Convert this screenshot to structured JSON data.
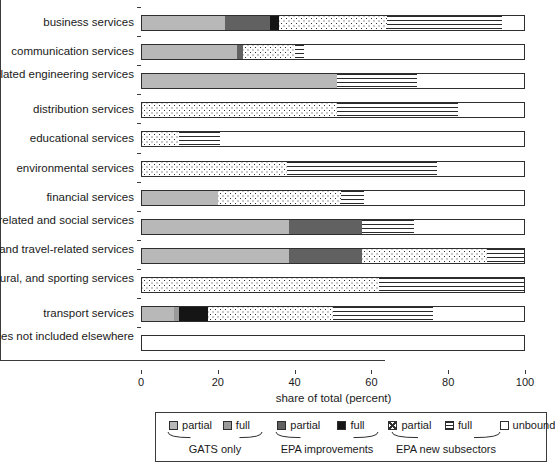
{
  "chart_data": {
    "type": "bar",
    "orientation": "horizontal",
    "stacked": true,
    "title": "",
    "xlabel": "share of total (percent)",
    "ylabel": "",
    "xlim": [
      0,
      100
    ],
    "xticks": [
      0,
      20,
      40,
      60,
      80,
      100
    ],
    "xtick_labels": [
      "0",
      "20",
      "40",
      "60",
      "80",
      "100"
    ],
    "grid": false,
    "legend_position": "bottom",
    "categories": [
      "business services",
      "communication services",
      "construction and related engineering services",
      "distribution services",
      "educational services",
      "environmental services",
      "financial services",
      "health-related and social services",
      "tourism and travel-related services",
      "recreational, cultural, and sporting services",
      "transport services",
      "other services not included elsewhere"
    ],
    "series": [
      {
        "name": "GATS only partial",
        "key": "gats_partial",
        "values": [
          22.0,
          25.0,
          51.0,
          0.0,
          0.0,
          0.0,
          20.0,
          38.5,
          38.5,
          0.0,
          8.5,
          0.0
        ]
      },
      {
        "name": "GATS only full",
        "key": "gats_full",
        "values": [
          0.0,
          0.0,
          0.0,
          0.0,
          0.0,
          0.0,
          0.0,
          0.0,
          0.0,
          0.0,
          1.5,
          0.0
        ]
      },
      {
        "name": "EPA improvements partial",
        "key": "epa_partial",
        "values": [
          11.5,
          1.5,
          0.0,
          0.0,
          0.0,
          0.0,
          0.0,
          19.0,
          19.0,
          0.0,
          0.0,
          0.0
        ]
      },
      {
        "name": "EPA improvements full",
        "key": "epa_full",
        "values": [
          2.5,
          0.0,
          0.0,
          0.0,
          0.0,
          0.0,
          0.0,
          0.0,
          0.0,
          0.0,
          7.5,
          0.0
        ]
      },
      {
        "name": "EPA new subsectors partial",
        "key": "new_partial",
        "values": [
          28.0,
          13.5,
          0.0,
          51.0,
          10.0,
          38.0,
          32.0,
          0.0,
          32.5,
          62.0,
          32.5,
          0.0
        ]
      },
      {
        "name": "EPA new subsectors full",
        "key": "new_full",
        "values": [
          30.0,
          2.5,
          21.0,
          31.5,
          10.5,
          39.0,
          6.0,
          13.5,
          10.0,
          38.0,
          26.0,
          0.0
        ]
      },
      {
        "name": "unbound",
        "key": "unbound",
        "values": [
          6.0,
          57.5,
          28.0,
          17.5,
          79.5,
          23.0,
          42.0,
          29.0,
          0.0,
          0.0,
          24.0,
          100.0
        ]
      }
    ]
  },
  "axis": {
    "xlabel": "share of total (percent)"
  },
  "legend": {
    "items": [
      {
        "label": "partial",
        "fill": "gats_partial"
      },
      {
        "label": "full",
        "fill": "gats_full"
      },
      {
        "label": "partial",
        "fill": "epa_partial"
      },
      {
        "label": "full",
        "fill": "epa_full"
      },
      {
        "label": "partial",
        "fill": "new_partial"
      },
      {
        "label": "full",
        "fill": "new_full"
      },
      {
        "label": "unbound",
        "fill": "unbound"
      }
    ],
    "groups": [
      {
        "label": "GATS only"
      },
      {
        "label": "EPA improvements"
      },
      {
        "label": "EPA new subsectors"
      }
    ]
  },
  "colors": {
    "gats_partial": "#b8b8b8",
    "gats_full": "#9a9a9a",
    "epa_partial": "#616161",
    "epa_full": "#151515",
    "unbound": "#ffffff",
    "axis": "#3b3b3b"
  }
}
